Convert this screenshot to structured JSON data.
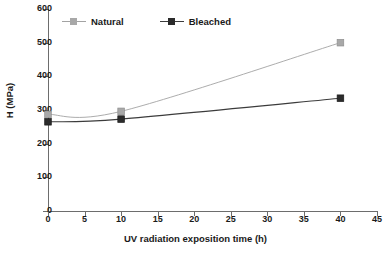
{
  "chart_data": {
    "type": "line",
    "title": "",
    "subtitle": "",
    "xlabel": "UV radiation exposition time (h)",
    "ylabel": "H (MPa)",
    "xlim": [
      0,
      45
    ],
    "ylim": [
      0,
      600
    ],
    "xticks": [
      0,
      5,
      10,
      15,
      20,
      25,
      30,
      35,
      40,
      45
    ],
    "yticks": [
      0,
      100,
      200,
      300,
      400,
      500,
      600
    ],
    "grid": false,
    "legend_position": "top-left-inside",
    "marker": "square",
    "x": [
      0,
      10,
      40
    ],
    "series": [
      {
        "name": "Natural",
        "values": [
          287,
          296,
          500
        ],
        "color": "#a3a3a3",
        "marker_color": "#a8a8a8"
      },
      {
        "name": "Bleached",
        "values": [
          265,
          273,
          335
        ],
        "color": "#3c3c3c",
        "marker_color": "#2b2b2b"
      }
    ],
    "legend": [
      "Natural",
      "Bleached"
    ]
  },
  "axes": {
    "y_tick_labels": [
      "600",
      "500",
      "400",
      "300",
      "200",
      "100",
      "0"
    ],
    "x_tick_labels": [
      "0",
      "5",
      "10",
      "15",
      "20",
      "25",
      "30",
      "35",
      "40",
      "45"
    ],
    "axis_color": "#6d6d6d",
    "text_color": "#1a1a1a"
  }
}
